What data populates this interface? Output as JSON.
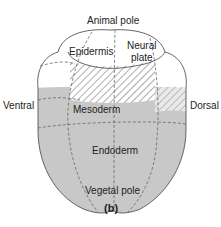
{
  "diagram": {
    "figure_label": "(b)",
    "poles": {
      "top": "Animal pole",
      "bottom": "Vegetal pole",
      "left": "Ventral",
      "right": "Dorsal"
    },
    "regions": [
      {
        "name": "Epidermis",
        "fill": "white"
      },
      {
        "name": "Neural plate",
        "fill": "white",
        "lines": [
          "Neural",
          "plate"
        ]
      },
      {
        "name": "Mesoderm",
        "fill": "#c8c8c8"
      },
      {
        "name": "Endoderm",
        "fill": "#c8c8c8"
      },
      {
        "name": "Notochord/neural boundary",
        "fill": "hatched"
      }
    ],
    "colors": {
      "grey_fill": "#c8c8c8",
      "outline": "#555555",
      "hatch": "#9a9a9a"
    }
  }
}
